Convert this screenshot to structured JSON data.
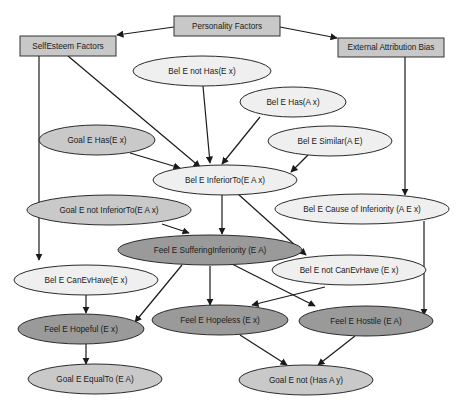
{
  "colors": {
    "box_fill": "#c8c8c8",
    "belief_fill": "#efefef",
    "goal_fill": "#c9c9c9",
    "feeling_fill": "#9a9a9a",
    "stroke": "#2a2a2a"
  },
  "nodes": {
    "personality_factors": "Personality Factors",
    "selfesteem_factors": "SelfEsteem Factors",
    "external_attribution_bias": "External Attribution Bias",
    "bel_not_has_ex": "Bel E not Has(E x)",
    "bel_has_ax": "Bel E Has(A x)",
    "goal_has_ex": "Goal E Has(E x)",
    "bel_similar_ae": "Bel E Similar(A E)",
    "bel_inferiorto_eax": "Bel E InferiorTo(E A x)",
    "goal_not_inferiorto_eax": "Goal E not InferiorTo(E A x)",
    "bel_cause_of_inferiority": "Bel E Cause of Inferiority (A E x)",
    "feel_suffering_inferiority": "Feel E SufferingInferiority (E A)",
    "bel_canevhave_ex": "Bel E CanEvHave(E x)",
    "bel_not_canevhave_ex": "Bel E not CanEvHave (E x)",
    "feel_hopeful_ex": "Feel E Hopeful (E x)",
    "feel_hopeless_ex": "Feel E Hopeless (E x)",
    "feel_hostile_ea": "Feel E Hostile (E A)",
    "goal_equalto_ea": "Goal E EqualTo (E A)",
    "goal_not_has_ay": "Goal E not (Has A y)"
  },
  "edges": [
    [
      "Personality Factors",
      "SelfEsteem Factors"
    ],
    [
      "Personality Factors",
      "External Attribution Bias"
    ],
    [
      "SelfEsteem Factors",
      "Bel E InferiorTo(E A x)"
    ],
    [
      "SelfEsteem Factors",
      "Bel E CanEvHave(E x)"
    ],
    [
      "External Attribution Bias",
      "Bel E Cause of Inferiority (A E x)"
    ],
    [
      "Bel E not Has(E x)",
      "Bel E InferiorTo(E A x)"
    ],
    [
      "Bel E Has(A x)",
      "Bel E InferiorTo(E A x)"
    ],
    [
      "Goal E Has(E x)",
      "Bel E InferiorTo(E A x)"
    ],
    [
      "Bel E Similar(A E)",
      "Bel E InferiorTo(E A x)"
    ],
    [
      "Bel E InferiorTo(E A x)",
      "Feel E SufferingInferiority (E A)"
    ],
    [
      "Bel E InferiorTo(E A x)",
      "Bel E not CanEvHave (E x)"
    ],
    [
      "Goal E not InferiorTo(E A x)",
      "Feel E SufferingInferiority (E A)"
    ],
    [
      "Feel E SufferingInferiority (E A)",
      "Feel E Hopeful (E x)"
    ],
    [
      "Feel E SufferingInferiority (E A)",
      "Feel E Hopeless (E x)"
    ],
    [
      "Feel E SufferingInferiority (E A)",
      "Feel E Hostile (E A)"
    ],
    [
      "Bel E CanEvHave(E x)",
      "Feel E Hopeful (E x)"
    ],
    [
      "Bel E not CanEvHave (E x)",
      "Feel E Hopeless (E x)"
    ],
    [
      "Bel E Cause of Inferiority (A E x)",
      "Feel E Hostile (E A)"
    ],
    [
      "Feel E Hopeful (E x)",
      "Goal E EqualTo (E A)"
    ],
    [
      "Feel E Hopeless (E x)",
      "Goal E not (Has A y)"
    ],
    [
      "Feel E Hostile (E A)",
      "Goal E not (Has A y)"
    ]
  ]
}
